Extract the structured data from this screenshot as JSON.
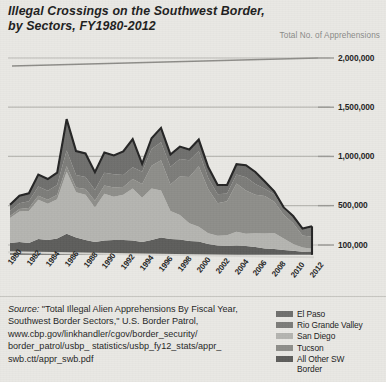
{
  "title": {
    "line1": "Illegal Crossings on the Southwest Border,",
    "line2": "by Sectors, FY1980-2012"
  },
  "axis_title": "Total No. of Apprehensions",
  "source": {
    "label": "Source:",
    "text": " \"Total Illegal Alien Apprehensions By Fiscal Year, Southwest Border Sectors,\" U.S. Border Patrol, www.cbp.gov/linkhandler/cgov/border_security/ border_patrol/usbp_ statistics/usbp_fy12_stats/appr_ swb.ctt/appr_swb.pdf"
  },
  "legend": {
    "items": [
      {
        "label": "El Paso",
        "color": "#6f6f6d"
      },
      {
        "label": "Rio Grande Valley",
        "color": "#7c7c79"
      },
      {
        "label": "San Diego",
        "color": "#b4b4b0"
      },
      {
        "label": "Tucson",
        "color": "#8e8e8a"
      },
      {
        "label": "All Other SW",
        "color": "#5d5d5b"
      }
    ],
    "continuation": "Border"
  },
  "chart_data": {
    "type": "area",
    "stacked": true,
    "title": "Illegal Crossings on the Southwest Border, by Sectors, FY1980-2012",
    "xlabel": "",
    "ylabel": "Total No. of Apprehensions",
    "ylim": [
      0,
      2000000
    ],
    "ytick_values": [
      100000,
      500000,
      1000000,
      1500000,
      2000000
    ],
    "ytick_labels": [
      "100,000",
      "500,000",
      "1,000,000",
      "1,500,000",
      "2,000,000"
    ],
    "grid": true,
    "legend_position": "bottom-right",
    "x": [
      1980,
      1981,
      1982,
      1983,
      1984,
      1985,
      1986,
      1987,
      1988,
      1989,
      1990,
      1991,
      1992,
      1993,
      1994,
      1995,
      1996,
      1997,
      1998,
      1999,
      2000,
      2001,
      2002,
      2003,
      2004,
      2005,
      2006,
      2007,
      2008,
      2009,
      2010,
      2011,
      2012
    ],
    "xtick_labels": [
      "1980",
      "1982",
      "1984",
      "1986",
      "1988",
      "1990",
      "1992",
      "1994",
      "1996",
      "1998",
      "2000",
      "2002",
      "2004",
      "2006",
      "2008",
      "2010",
      "2012"
    ],
    "series": [
      {
        "name": "All Other SW Border",
        "color": "#5d5d5b",
        "values": [
          120000,
          130000,
          120000,
          160000,
          150000,
          165000,
          215000,
          175000,
          150000,
          130000,
          145000,
          150000,
          150000,
          145000,
          130000,
          150000,
          175000,
          160000,
          155000,
          140000,
          135000,
          110000,
          95000,
          90000,
          95000,
          90000,
          80000,
          65000,
          60000,
          48000,
          42000,
          32000,
          34000
        ]
      },
      {
        "name": "San Diego",
        "color": "#b4b4b0",
        "values": [
          255000,
          310000,
          325000,
          400000,
          370000,
          400000,
          629000,
          460000,
          460000,
          350000,
          475000,
          440000,
          460000,
          530000,
          450000,
          525000,
          480000,
          285000,
          250000,
          180000,
          150000,
          110000,
          100000,
          110000,
          140000,
          125000,
          140000,
          152000,
          162000,
          118000,
          68000,
          42000,
          29000
        ]
      },
      {
        "name": "Tucson",
        "color": "#8e8e8a",
        "values": [
          20000,
          25000,
          30000,
          40000,
          40000,
          45000,
          55000,
          50000,
          60000,
          70000,
          85000,
          95000,
          80000,
          95000,
          140000,
          230000,
          305000,
          270000,
          390000,
          470000,
          615000,
          450000,
          330000,
          345000,
          490000,
          440000,
          390000,
          380000,
          317000,
          241000,
          212000,
          123000,
          120000
        ]
      },
      {
        "name": "Rio Grande Valley",
        "color": "#7c7c79",
        "values": [
          50000,
          60000,
          70000,
          95000,
          90000,
          100000,
          160000,
          125000,
          120000,
          110000,
          130000,
          135000,
          120000,
          120000,
          125000,
          170000,
          185000,
          180000,
          180000,
          170000,
          155000,
          110000,
          90000,
          78000,
          92000,
          134000,
          110000,
          74000,
          76000,
          61000,
          60000,
          60000,
          98000
        ]
      },
      {
        "name": "El Paso",
        "color": "#6f6f6d",
        "values": [
          65000,
          75000,
          80000,
          120000,
          120000,
          125000,
          320000,
          245000,
          240000,
          180000,
          205000,
          190000,
          240000,
          285000,
          80000,
          110000,
          145000,
          125000,
          125000,
          110000,
          116000,
          112000,
          94000,
          88000,
          104000,
          122000,
          122000,
          75000,
          30000,
          14000,
          12000,
          10000,
          9000
        ]
      }
    ]
  }
}
